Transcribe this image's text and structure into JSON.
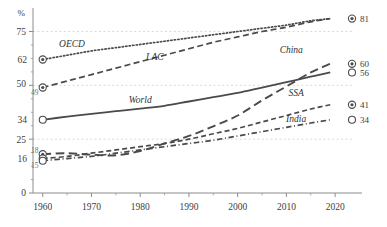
{
  "chart_data": {
    "type": "line",
    "title": "",
    "xlabel": "",
    "ylabel": "%",
    "xlim": [
      1958,
      2021
    ],
    "ylim": [
      0,
      85
    ],
    "grid": "horizontal-dashed",
    "legend": "inline-endpoint-labels",
    "x_ticks": [
      1960,
      1970,
      1980,
      1990,
      2000,
      2010,
      2020
    ],
    "x_minor_ticks": [
      1965,
      1975,
      1985,
      1995,
      2005,
      2015
    ],
    "y_ticks": [
      0,
      25,
      50,
      75
    ],
    "y_gridlines": [
      25,
      50,
      75
    ],
    "y_start_annotations": [
      {
        "value": 62,
        "text": "62",
        "size": "large"
      },
      {
        "value": 50,
        "text": "50",
        "size": "large"
      },
      {
        "value": 49,
        "text": "49",
        "size": "small"
      },
      {
        "value": 34,
        "text": "34",
        "size": "large"
      },
      {
        "value": 18,
        "text": "18",
        "size": "small"
      },
      {
        "value": 16,
        "text": "16",
        "size": "large"
      },
      {
        "value": 15,
        "text": "15",
        "size": "small"
      }
    ],
    "series": [
      {
        "name": "OECD",
        "style": "dotted",
        "label_x": 1966,
        "label_y": 68,
        "start_value": 62,
        "end_value": 81,
        "end_marker": "target",
        "x": [
          1960,
          1965,
          1970,
          1975,
          1980,
          1985,
          1990,
          1995,
          2000,
          2005,
          2010,
          2015,
          2019
        ],
        "values": [
          62,
          64,
          66,
          67.5,
          69,
          70.5,
          72,
          73.5,
          75,
          76.5,
          78,
          80,
          81
        ]
      },
      {
        "name": "LAC",
        "style": "dashed-long",
        "label_x": 1983,
        "label_y": 62,
        "start_value": 49,
        "end_value": 81,
        "end_marker": "target",
        "x": [
          1960,
          1965,
          1970,
          1975,
          1980,
          1985,
          1990,
          1995,
          2000,
          2005,
          2010,
          2015,
          2019
        ],
        "values": [
          49,
          52,
          55,
          58,
          61,
          64,
          67,
          70,
          72.5,
          75,
          77,
          79.5,
          81
        ]
      },
      {
        "name": "World",
        "style": "solid",
        "label_x": 1980,
        "label_y": 42,
        "start_value": 34,
        "end_value": 56,
        "end_marker": "open",
        "x": [
          1960,
          1965,
          1970,
          1975,
          1980,
          1985,
          1990,
          1995,
          2000,
          2005,
          2010,
          2015,
          2019
        ],
        "values": [
          34,
          35.5,
          36.8,
          38,
          39.2,
          40.5,
          42.5,
          44.5,
          46.5,
          49,
          51.5,
          54,
          56
        ]
      },
      {
        "name": "China",
        "style": "dashed-xlong",
        "label_x": 2011,
        "label_y": 65,
        "start_value": 18,
        "end_value": 60,
        "end_marker": "target",
        "x": [
          1960,
          1965,
          1970,
          1975,
          1980,
          1985,
          1990,
          1995,
          2000,
          2005,
          2010,
          2015,
          2019
        ],
        "values": [
          18,
          18.5,
          17.8,
          17.5,
          19.5,
          23,
          26.5,
          31,
          36,
          43,
          49.5,
          56,
          60
        ]
      },
      {
        "name": "SSA",
        "style": "dashed-med",
        "label_x": 2012,
        "label_y": 45,
        "start_value": 16,
        "end_value": 41,
        "end_marker": "target",
        "x": [
          1960,
          1965,
          1970,
          1975,
          1980,
          1985,
          1990,
          1995,
          2000,
          2005,
          2010,
          2015,
          2019
        ],
        "values": [
          16,
          17,
          18.5,
          20,
          21.5,
          23,
          25,
          27.5,
          30,
          33,
          36,
          39,
          41
        ]
      },
      {
        "name": "India",
        "style": "dash-dot",
        "label_x": 2012,
        "label_y": 33,
        "start_value": 15,
        "end_value": 34,
        "end_marker": "open",
        "x": [
          1960,
          1965,
          1970,
          1975,
          1980,
          1985,
          1990,
          1995,
          2000,
          2005,
          2010,
          2015,
          2019
        ],
        "values": [
          15,
          16,
          17,
          18.5,
          20,
          21.5,
          23,
          24.5,
          26.5,
          28.5,
          30.5,
          32.5,
          34
        ]
      }
    ],
    "end_labels": [
      {
        "series": "OECD",
        "value": "81",
        "marker": "target",
        "y": 81
      },
      {
        "series": "LAC",
        "value": "81",
        "marker": "target",
        "y": 81,
        "hidden_marker": true
      },
      {
        "series": "China",
        "value": "60",
        "marker": "target",
        "y": 60
      },
      {
        "series": "World",
        "value": "56",
        "marker": "open",
        "y": 56
      },
      {
        "series": "SSA",
        "value": "41",
        "marker": "target",
        "y": 41
      },
      {
        "series": "India",
        "value": "34",
        "marker": "open",
        "y": 34
      }
    ],
    "colors": {
      "line": "#4a4a4a",
      "axis": "#8c8c8c",
      "grid": "#c9c9c9",
      "text": "#3d3d3d",
      "text_muted": "#6f6f6f",
      "background": "#ffffff"
    }
  }
}
